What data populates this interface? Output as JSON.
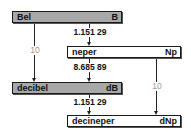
{
  "diagram": {
    "type": "unit-conversion-diagram",
    "nodes": [
      {
        "id": "bel",
        "name": "Bel",
        "symbol": "B",
        "style": "shaded"
      },
      {
        "id": "neper",
        "name": "neper",
        "symbol": "Np",
        "style": "plain"
      },
      {
        "id": "decibel",
        "name": "decibel",
        "symbol": "dB",
        "style": "shaded"
      },
      {
        "id": "decineper",
        "name": "decineper",
        "symbol": "dNp",
        "style": "plain"
      }
    ],
    "edges": [
      {
        "from": "bel",
        "to": "neper",
        "factor": "1.151 29"
      },
      {
        "from": "neper",
        "to": "decibel",
        "factor": "8.685 89"
      },
      {
        "from": "decibel",
        "to": "decineper",
        "factor": "1.151 29"
      },
      {
        "from": "bel",
        "to": "decibel",
        "factor": "10"
      },
      {
        "from": "neper",
        "to": "decineper",
        "factor": "10"
      }
    ]
  },
  "labels": {
    "bel_name": "Bel",
    "bel_symbol": "B",
    "neper_name": "neper",
    "neper_symbol": "Np",
    "decibel_name": "decibel",
    "decibel_symbol": "dB",
    "decineper_name": "decineper",
    "decineper_symbol": "dNp",
    "bel_to_neper": "1.151 29",
    "neper_to_decibel": "8.685 89",
    "decibel_to_decineper": "1.151 29",
    "bel_to_decibel": "10",
    "neper_to_decineper": "10"
  },
  "colors": {
    "shaded_box": "#a8a8a8",
    "plain_box": "#ffffff",
    "line": "#222222",
    "grey_factor": "#999999"
  }
}
